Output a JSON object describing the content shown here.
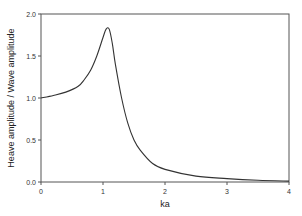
{
  "chart_data": {
    "type": "line",
    "title": "",
    "xlabel": "ka",
    "ylabel": "Heave amplitude / Wave amplitude",
    "xlim": [
      0,
      4
    ],
    "ylim": [
      0,
      2.0
    ],
    "xticks": [
      "0",
      "1",
      "2",
      "3",
      "4"
    ],
    "yticks": [
      "0.0",
      "0.5",
      "1.0",
      "1.5",
      "2.0"
    ],
    "grid": false,
    "legend": null,
    "series": [
      {
        "name": "Heave RAO",
        "x": [
          0.0,
          0.2,
          0.4,
          0.6,
          0.7,
          0.8,
          0.9,
          1.0,
          1.05,
          1.1,
          1.15,
          1.2,
          1.3,
          1.4,
          1.5,
          1.6,
          1.8,
          2.0,
          2.5,
          3.0,
          3.5,
          4.0
        ],
        "y": [
          1.0,
          1.03,
          1.07,
          1.14,
          1.22,
          1.33,
          1.5,
          1.72,
          1.82,
          1.82,
          1.65,
          1.4,
          1.0,
          0.7,
          0.5,
          0.38,
          0.22,
          0.15,
          0.07,
          0.04,
          0.02,
          0.01
        ]
      }
    ],
    "color": "#333333"
  }
}
